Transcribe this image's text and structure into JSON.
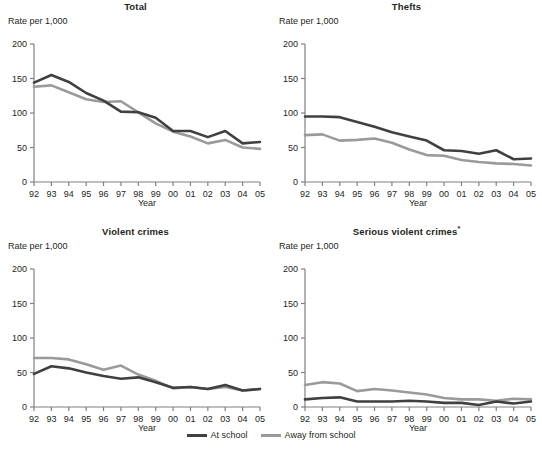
{
  "figure": {
    "axis_label_y": "Rate per 1,000",
    "axis_label_x": "Year",
    "footnote_marker": "*"
  },
  "legend": {
    "position": "bottom-center",
    "items": [
      {
        "name": "At school",
        "color": "#404040"
      },
      {
        "name": "Away from school",
        "color": "#9a9a9a"
      }
    ]
  },
  "axes": {
    "y_ticks": [
      "0",
      "50",
      "100",
      "150",
      "200"
    ],
    "y_tick_values": [
      0,
      50,
      100,
      150,
      200
    ],
    "ylim": [
      0,
      200
    ],
    "x_ticks": [
      "92",
      "93",
      "94",
      "95",
      "96",
      "97",
      "98",
      "99",
      "00",
      "01",
      "02",
      "03",
      "04",
      "05"
    ],
    "grid": false
  },
  "chart_data": [
    {
      "type": "line",
      "title": "Total",
      "xlabel": "Year",
      "ylabel": "Rate per 1,000",
      "ylim": [
        0,
        200
      ],
      "categories": [
        "92",
        "93",
        "94",
        "95",
        "96",
        "97",
        "98",
        "99",
        "00",
        "01",
        "02",
        "03",
        "04",
        "05"
      ],
      "series": [
        {
          "name": "At school",
          "color": "#404040",
          "values": [
            144,
            155,
            145,
            129,
            118,
            102,
            101,
            93,
            74,
            74,
            65,
            74,
            56,
            58
          ]
        },
        {
          "name": "Away from school",
          "color": "#9a9a9a",
          "values": [
            138,
            140,
            130,
            120,
            116,
            117,
            101,
            85,
            73,
            66,
            56,
            61,
            50,
            48
          ]
        }
      ]
    },
    {
      "type": "line",
      "title": "Thefts",
      "xlabel": "Year",
      "ylabel": "Rate per 1,000",
      "ylim": [
        0,
        200
      ],
      "categories": [
        "92",
        "93",
        "94",
        "95",
        "96",
        "97",
        "98",
        "99",
        "00",
        "01",
        "02",
        "03",
        "04",
        "05"
      ],
      "series": [
        {
          "name": "At school",
          "color": "#404040",
          "values": [
            95,
            95,
            94,
            87,
            80,
            72,
            66,
            60,
            46,
            45,
            41,
            46,
            33,
            34
          ]
        },
        {
          "name": "Away from school",
          "color": "#9a9a9a",
          "values": [
            68,
            69,
            60,
            61,
            63,
            57,
            47,
            39,
            38,
            32,
            29,
            27,
            26,
            24
          ]
        }
      ]
    },
    {
      "type": "line",
      "title": "Violent crimes",
      "xlabel": "Year",
      "ylabel": "Rate per 1,000",
      "ylim": [
        0,
        200
      ],
      "categories": [
        "92",
        "93",
        "94",
        "95",
        "96",
        "97",
        "98",
        "99",
        "00",
        "01",
        "02",
        "03",
        "04",
        "05"
      ],
      "series": [
        {
          "name": "At school",
          "color": "#404040",
          "values": [
            48,
            59,
            56,
            50,
            45,
            41,
            43,
            36,
            28,
            29,
            26,
            32,
            24,
            26
          ]
        },
        {
          "name": "Away from school",
          "color": "#9a9a9a",
          "values": [
            71,
            71,
            69,
            62,
            54,
            60,
            47,
            38,
            27,
            29,
            26,
            29,
            24,
            26
          ]
        }
      ]
    },
    {
      "type": "line",
      "title": "Serious violent crimes",
      "title_footnote": "*",
      "xlabel": "Year",
      "ylabel": "Rate per 1,000",
      "ylim": [
        0,
        200
      ],
      "categories": [
        "92",
        "93",
        "94",
        "95",
        "96",
        "97",
        "98",
        "99",
        "00",
        "01",
        "02",
        "03",
        "04",
        "05"
      ],
      "series": [
        {
          "name": "At school",
          "color": "#404040",
          "values": [
            11,
            13,
            14,
            8,
            8,
            8,
            9,
            8,
            6,
            6,
            3,
            8,
            5,
            8
          ]
        },
        {
          "name": "Away from school",
          "color": "#9a9a9a",
          "values": [
            32,
            36,
            34,
            23,
            26,
            24,
            21,
            18,
            13,
            11,
            11,
            9,
            12,
            11
          ]
        }
      ]
    }
  ]
}
